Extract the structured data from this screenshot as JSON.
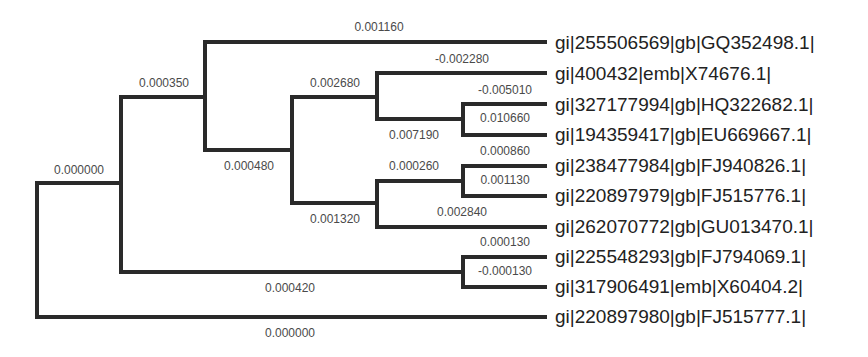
{
  "diagram": {
    "type": "phylogenetic-tree",
    "leaves": [
      {
        "label": "gi|255506569|gb|GQ352498.1|"
      },
      {
        "label": "gi|400432|emb|X74676.1|"
      },
      {
        "label": "gi|327177994|gb|HQ322682.1|"
      },
      {
        "label": "gi|194359417|gb|EU669667.1|"
      },
      {
        "label": "gi|238477984|gb|FJ940826.1|"
      },
      {
        "label": "gi|220897979|gb|FJ515776.1|"
      },
      {
        "label": "gi|262070772|gb|GU013470.1|"
      },
      {
        "label": "gi|225548293|gb|FJ794069.1|"
      },
      {
        "label": "gi|317906491|emb|X60404.2|"
      },
      {
        "label": "gi|220897980|gb|FJ515777.1|"
      }
    ],
    "branch_lengths": {
      "root_upper": "0.000000",
      "root_lower": "0.000000",
      "a_upper": "0.000350",
      "a_lower": "0.000420",
      "b_upper": "0.001160",
      "b_lower": "0.000480",
      "c_upper": "0.002680",
      "c_lower": "0.001320",
      "d_upper": "-0.002280",
      "d_lower": "0.007190",
      "e_upper": "-0.005010",
      "e_lower": "0.010660",
      "f_upper": "0.000260",
      "f_lower": "0.002840",
      "g_upper": "0.000860",
      "g_lower": "0.001130",
      "h_upper": "0.000130",
      "h_lower": "-0.000130"
    }
  }
}
